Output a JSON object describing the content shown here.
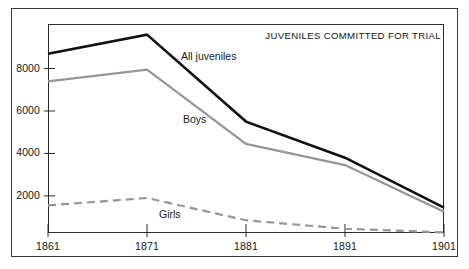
{
  "chart_data": {
    "type": "line",
    "title": "JUVENILES COMMITTED FOR TRIAL",
    "xlabel": "",
    "ylabel": "",
    "x": [
      1861,
      1871,
      1881,
      1891,
      1901
    ],
    "xtick_labels": [
      "1861",
      "1871",
      "1881",
      "1891",
      "1901"
    ],
    "ytick_labels": [
      "2000",
      "4000",
      "6000",
      "8000"
    ],
    "yticks": [
      2000,
      4000,
      6000,
      8000
    ],
    "xlim": [
      1861,
      1901
    ],
    "ylim": [
      250,
      10100
    ],
    "grid": false,
    "legend_position": "inline-annotations",
    "series": [
      {
        "name": "All juveniles",
        "label": "All juveniles",
        "color": "#111111",
        "style": "solid",
        "width": 2.6,
        "values": [
          8700,
          9600,
          5500,
          3800,
          1450
        ]
      },
      {
        "name": "Boys",
        "label": "Boys",
        "color": "#969696",
        "style": "solid",
        "width": 2.2,
        "values": [
          7400,
          7950,
          4450,
          3450,
          1250
        ]
      },
      {
        "name": "Girls",
        "label": "Girls",
        "color": "#969696",
        "style": "dashed",
        "width": 2.2,
        "values": [
          1550,
          1900,
          850,
          450,
          280
        ]
      }
    ],
    "annotations": [
      {
        "text": "All juveniles",
        "series": "All juveniles"
      },
      {
        "text": "Boys",
        "series": "Boys"
      },
      {
        "text": "Girls",
        "series": "Girls"
      }
    ]
  },
  "colors": {
    "background": "#ffffff",
    "frame": "#3a3a3a",
    "axis": "#2b2b2b",
    "series_all": "#111111",
    "series_boys": "#969696",
    "series_girls": "#969696",
    "text": "#161616"
  }
}
